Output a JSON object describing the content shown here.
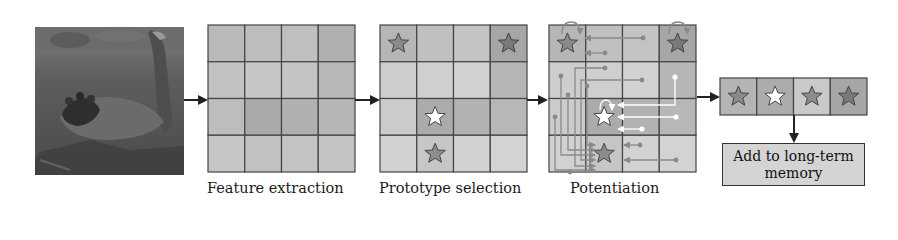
{
  "stages": [
    {
      "id": "input",
      "label": ""
    },
    {
      "id": "feature_extraction",
      "label": "Feature extraction"
    },
    {
      "id": "prototype_selection",
      "label": "Prototype selection"
    },
    {
      "id": "potentiation",
      "label": "Potentiation"
    },
    {
      "id": "memory",
      "label": ""
    }
  ],
  "input_image": {
    "subject": "black swan on water"
  },
  "feature_grid": {
    "rows": 4,
    "cols": 4,
    "shades": [
      [
        "#b9b9b9",
        "#bdbdbd",
        "#bfbfbf",
        "#b0b0b0"
      ],
      [
        "#c2c2c2",
        "#c6c6c6",
        "#c4c4c4",
        "#b7b7b7"
      ],
      [
        "#bdbdbd",
        "#a9a9a9",
        "#b0b0b0",
        "#b6b6b6"
      ],
      [
        "#c6c6c6",
        "#c1c1c1",
        "#c3c3c3",
        "#c4c4c4"
      ]
    ]
  },
  "prototype_grid": {
    "rows": 4,
    "cols": 4,
    "shades": [
      [
        "#b6b6b6",
        "#c0c0c0",
        "#c3c3c3",
        "#a6a6a6"
      ],
      [
        "#cdcdcd",
        "#cfcfcf",
        "#d2d2d2",
        "#b6b6b6"
      ],
      [
        "#cbcbcb",
        "#ababab",
        "#b2b2b2",
        "#b7b7b7"
      ],
      [
        "#d1d1d1",
        "#c6c6c6",
        "#d2d2d2",
        "#d3d3d3"
      ]
    ],
    "prototypes": [
      {
        "row": 0,
        "col": 0,
        "fill": "#8a8a8a"
      },
      {
        "row": 0,
        "col": 3,
        "fill": "#7a7a7a"
      },
      {
        "row": 2,
        "col": 1,
        "fill": "#ffffff"
      },
      {
        "row": 3,
        "col": 1,
        "fill": "#8d8d8d"
      }
    ]
  },
  "potentiation_grid": {
    "rows": 4,
    "cols": 4,
    "shades": [
      [
        "#b6b6b6",
        "#c0c0c0",
        "#c3c3c3",
        "#a6a6a6"
      ],
      [
        "#cdcdcd",
        "#cfcfcf",
        "#d2d2d2",
        "#b6b6b6"
      ],
      [
        "#cbcbcb",
        "#ababab",
        "#b2b2b2",
        "#b7b7b7"
      ],
      [
        "#d1d1d1",
        "#c6c6c6",
        "#d2d2d2",
        "#d3d3d3"
      ]
    ],
    "highlight_color": "#ffffff",
    "connection_color": "#8a8a8a"
  },
  "memory_row": {
    "cells": [
      {
        "shade": "#b4b4b4",
        "star": "#8a8a8a"
      },
      {
        "shade": "#acacac",
        "star": "#ffffff"
      },
      {
        "shade": "#c9c9c9",
        "star": "#8d8d8d"
      },
      {
        "shade": "#a6a6a6",
        "star": "#7a7a7a"
      }
    ]
  },
  "long_term_memory": {
    "label": "Add to long-term memory"
  },
  "colors": {
    "arrow": "#222222",
    "grid_line": "#444444"
  }
}
